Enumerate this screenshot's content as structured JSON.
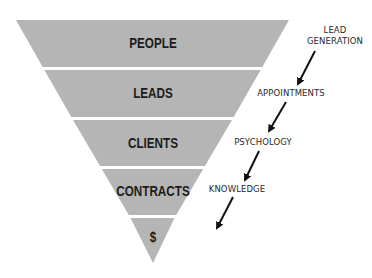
{
  "diagram": {
    "type": "inverted-funnel",
    "colors": {
      "funnel_fill": "#b5b5b5",
      "separator": "#ffffff",
      "text": "#1c1c1c",
      "arrow": "#111111"
    },
    "stages": [
      {
        "label": "PEOPLE"
      },
      {
        "label": "LEADS"
      },
      {
        "label": "CLIENTS"
      },
      {
        "label": "CONTRACTS"
      },
      {
        "label": "$"
      }
    ],
    "transitions": [
      {
        "label_line1": "LEAD",
        "label_line2": "GENERATION"
      },
      {
        "label_line1": "APPOINTMENTS"
      },
      {
        "label_line1": "PSYCHOLOGY"
      },
      {
        "label_line1": "KNOWLEDGE"
      }
    ]
  }
}
